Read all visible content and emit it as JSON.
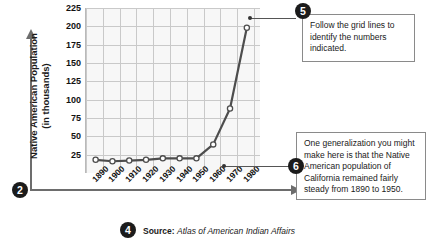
{
  "chart_data": {
    "type": "line",
    "title": "",
    "xlabel": "",
    "ylabel": "Native American Population (in thousands)",
    "categories": [
      "1890",
      "1900",
      "1910",
      "1920",
      "1930",
      "1940",
      "1950",
      "1960",
      "1970",
      "1980"
    ],
    "values": [
      18,
      16,
      17,
      18,
      20,
      20,
      20,
      39,
      88,
      198
    ],
    "ylim": [
      0,
      225
    ],
    "yticks": [
      225,
      200,
      175,
      150,
      125,
      100,
      75,
      50,
      25
    ],
    "grid": true,
    "legend": null,
    "marker": "open-circle",
    "line_color": "#4d4d4d"
  },
  "axis": {
    "y_title_line1": "Native American Population",
    "y_title_line2": "(in thousands)"
  },
  "source": {
    "label": "Source:",
    "text": "Atlas of American Indian Affairs"
  },
  "callouts": [
    {
      "number": "5",
      "text": "Follow the grid lines to identify the numbers indicated."
    },
    {
      "number": "6",
      "text": "One generalization you might make here is that the Native American population of California remained fairly steady from 1890 to 1950."
    }
  ],
  "markers": [
    {
      "number": "2",
      "name": "y-axis-marker"
    },
    {
      "number": "4",
      "name": "source-marker"
    }
  ]
}
